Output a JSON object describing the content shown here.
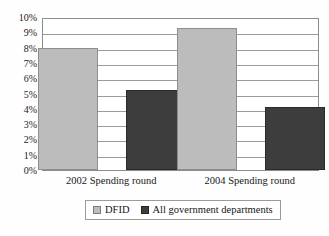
{
  "chart_data": {
    "type": "bar",
    "title": "",
    "subtitle": "",
    "xlabel": "",
    "ylabel": "",
    "categories": [
      "2002 Spending round",
      "2004 Spending round"
    ],
    "series": [
      {
        "name": "DFID",
        "values": [
          8.0,
          9.3
        ],
        "color": "#bcbcbc"
      },
      {
        "name": "All government departments",
        "values": [
          5.2,
          4.1
        ],
        "color": "#3d3d3d"
      }
    ],
    "ylim": [
      0,
      10
    ],
    "ytick_values": [
      0,
      1,
      2,
      3,
      4,
      5,
      6,
      7,
      8,
      9,
      10
    ],
    "ytick_labels": [
      "0%",
      "1%",
      "2%",
      "3%",
      "4%",
      "5%",
      "6%",
      "7%",
      "8%",
      "9%",
      "10%"
    ],
    "grid": true,
    "grid_axis": "y",
    "legend_position": "bottom"
  },
  "legend": {
    "entries": [
      {
        "label": "DFID"
      },
      {
        "label": "All government departments"
      }
    ]
  }
}
